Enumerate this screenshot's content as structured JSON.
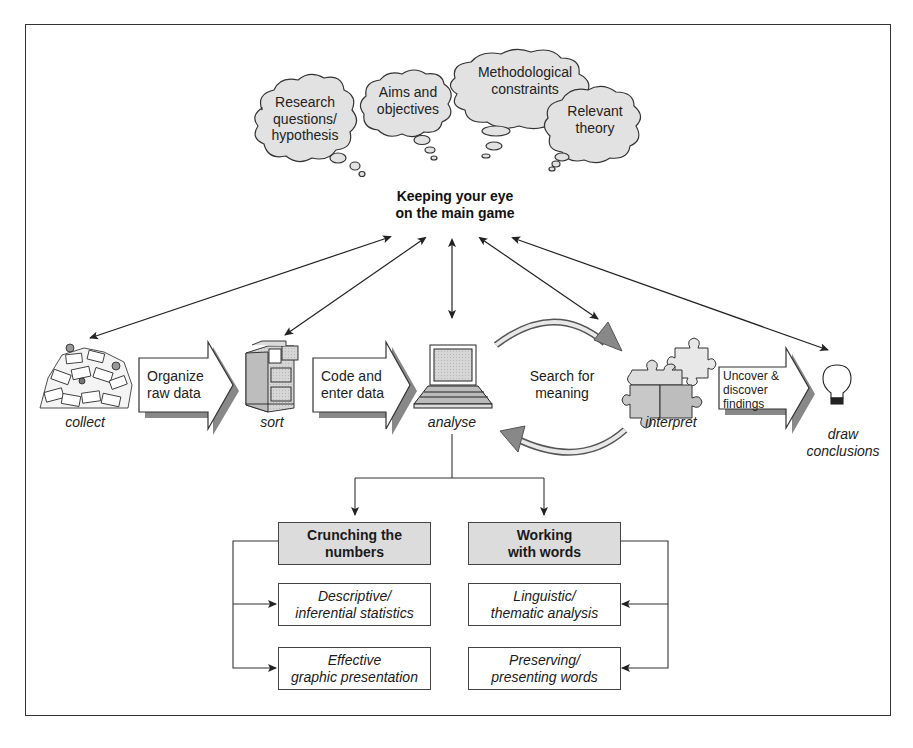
{
  "clouds": [
    {
      "id": "research",
      "line1": "Research",
      "line2": "questions/",
      "line3": "hypothesis"
    },
    {
      "id": "aims",
      "line1": "Aims and",
      "line2": "objectives"
    },
    {
      "id": "methodological",
      "line1": "Methodological",
      "line2": "constraints"
    },
    {
      "id": "theory",
      "line1": "Relevant",
      "line2": "theory"
    }
  ],
  "main_goal": {
    "line1": "Keeping your eye",
    "line2": "on the main game"
  },
  "steps": [
    {
      "id": "collect",
      "label": "collect",
      "icon": "paper-pile-icon"
    },
    {
      "id": "sort",
      "label": "sort",
      "icon": "filing-cabinet-icon"
    },
    {
      "id": "analyse",
      "label": "analyse",
      "icon": "laptop-icon"
    },
    {
      "id": "interpret",
      "label": "interpret",
      "icon": "puzzle-pieces-icon"
    },
    {
      "id": "draw",
      "line1": "draw",
      "line2": "conclusions",
      "icon": "light-bulb-icon"
    }
  ],
  "transitions": [
    {
      "id": "organize",
      "line1": "Organize",
      "line2": "raw data"
    },
    {
      "id": "code",
      "line1": "Code and",
      "line2": "enter data"
    },
    {
      "id": "search",
      "line1": "Search for",
      "line2": "meaning"
    },
    {
      "id": "uncover",
      "line1": "Uncover &",
      "line2": "discover",
      "line3": "findings"
    }
  ],
  "branches": {
    "numbers": {
      "heading": {
        "line1": "Crunching the",
        "line2": "numbers"
      },
      "items": [
        {
          "line1": "Descriptive/",
          "line2": "inferential statistics"
        },
        {
          "line1": "Effective",
          "line2": "graphic presentation"
        }
      ]
    },
    "words": {
      "heading": {
        "line1": "Working",
        "line2": "with words"
      },
      "items": [
        {
          "line1": "Linguistic/",
          "line2": "thematic analysis"
        },
        {
          "line1": "Preserving/",
          "line2": "presenting words"
        }
      ]
    }
  },
  "colors": {
    "heading_fill": "#dcdcdc",
    "cloud_fill": "#e2e2e2",
    "line": "#333333"
  }
}
